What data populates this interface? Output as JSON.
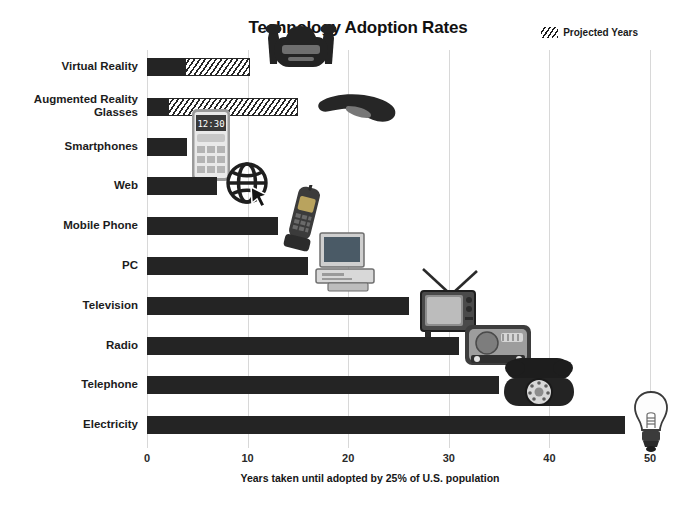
{
  "chart_data": {
    "type": "bar",
    "orientation": "horizontal",
    "title": "Technology Adoption Rates",
    "xlabel": "Years taken until adopted by 25% of U.S. population",
    "ylabel": "",
    "xlim": [
      0,
      50
    ],
    "xticks": [
      0,
      10,
      20,
      30,
      40,
      50
    ],
    "grid": true,
    "legend": {
      "position": "top-right",
      "entries": [
        {
          "label": "Projected Years",
          "pattern": "diagonal-hatch"
        }
      ]
    },
    "categories": [
      "Virtual Reality",
      "Augmented Reality Glasses",
      "Smartphones",
      "Web",
      "Mobile Phone",
      "PC",
      "Television",
      "Radio",
      "Telephone",
      "Electricity"
    ],
    "series": [
      {
        "name": "Years to adoption",
        "values": [
          10.2,
          15.0,
          4.0,
          7.0,
          13.0,
          16.0,
          26.0,
          31.0,
          35.0,
          47.5
        ]
      },
      {
        "name": "Actual (non-projected) portion",
        "values": [
          3.8,
          2.1,
          4.0,
          7.0,
          13.0,
          16.0,
          26.0,
          31.0,
          35.0,
          47.5
        ]
      },
      {
        "name": "Projected Years",
        "values": [
          6.4,
          12.9,
          0,
          0,
          0,
          0,
          0,
          0,
          0,
          0
        ]
      }
    ],
    "bars": [
      {
        "category": "Virtual Reality",
        "total": 10.2,
        "actual": 3.8,
        "projected": 6.4,
        "icon": "vr-headset-icon"
      },
      {
        "category": "Augmented Reality Glasses",
        "total": 15.0,
        "actual": 2.1,
        "projected": 12.9,
        "icon": "ar-glasses-icon"
      },
      {
        "category": "Smartphones",
        "total": 4.0,
        "actual": 4.0,
        "projected": 0,
        "icon": "smartphone-icon"
      },
      {
        "category": "Web",
        "total": 7.0,
        "actual": 7.0,
        "projected": 0,
        "icon": "globe-cursor-icon"
      },
      {
        "category": "Mobile Phone",
        "total": 13.0,
        "actual": 13.0,
        "projected": 0,
        "icon": "flip-phone-icon"
      },
      {
        "category": "PC",
        "total": 16.0,
        "actual": 16.0,
        "projected": 0,
        "icon": "desktop-computer-icon"
      },
      {
        "category": "Television",
        "total": 26.0,
        "actual": 26.0,
        "projected": 0,
        "icon": "crt-television-icon"
      },
      {
        "category": "Radio",
        "total": 31.0,
        "actual": 31.0,
        "projected": 0,
        "icon": "vintage-radio-icon"
      },
      {
        "category": "Telephone",
        "total": 35.0,
        "actual": 35.0,
        "projected": 0,
        "icon": "rotary-telephone-icon"
      },
      {
        "category": "Electricity",
        "total": 47.5,
        "actual": 47.5,
        "projected": 0,
        "icon": "light-bulb-icon"
      }
    ],
    "colors": {
      "bar": "#242424",
      "projected_hatch": "#262626",
      "grid": "#d8d8d8",
      "background": "#ffffff",
      "text": "#1a1a1a"
    }
  }
}
